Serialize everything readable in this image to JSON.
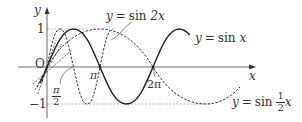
{
  "figure": {
    "axes": {
      "x_label": "x",
      "y_label": "y",
      "origin_label": "O"
    },
    "ticks": {
      "y_one": "1",
      "y_minus_one": "−1",
      "pi": "π",
      "two_pi": "2π",
      "half_pi": {
        "num": "π",
        "den": "2"
      }
    },
    "curves": [
      {
        "id": "sin-x",
        "label_prefix": "y",
        "label_eq": "=",
        "label_fn": "sin",
        "label_arg": "x",
        "style": "solid"
      },
      {
        "id": "sin-2x",
        "label_prefix": "y",
        "label_eq": "=",
        "label_fn": "sin",
        "label_arg": "2x",
        "style": "dashed"
      },
      {
        "id": "sin-half-x",
        "label_prefix": "y",
        "label_eq": "=",
        "label_fn": "sin",
        "label_frac_num": "1",
        "label_frac_den": "2",
        "label_arg": "x",
        "style": "dashed"
      }
    ],
    "colors": {
      "ink": "#333333",
      "guide": "#888888",
      "background": "#ffffff"
    }
  }
}
